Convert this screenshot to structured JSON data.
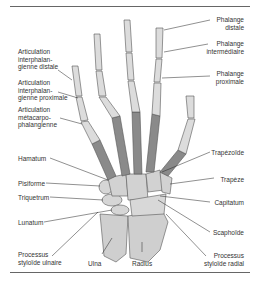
{
  "diagram": {
    "colors": {
      "phalanges": "#dcdcdc",
      "metacarpals": "#8a8a8a",
      "carpals": "#d2d2d2",
      "forearm": "#cfcfcf",
      "outline": "#555555",
      "leader": "#222222"
    },
    "labels_left": [
      {
        "id": "art-ipd",
        "text": "Articulation\ninterphalan-\ngienne distale"
      },
      {
        "id": "art-ipp",
        "text": "Articulation\ninterphalan-\ngienne proximale"
      },
      {
        "id": "art-mcp",
        "text": "Articulation\nmétacarpo-\nphalangienne"
      },
      {
        "id": "hamatum",
        "text": "Hamatum"
      },
      {
        "id": "pisiforme",
        "text": "Pisiforme"
      },
      {
        "id": "triquetrum",
        "text": "Triquetrum"
      },
      {
        "id": "lunatum",
        "text": "Lunatum"
      },
      {
        "id": "proc-ulnaire",
        "text": "Processus\nstyloïde ulnaire"
      }
    ],
    "labels_right": [
      {
        "id": "phal-distale",
        "text": "Phalange\ndistale"
      },
      {
        "id": "phal-inter",
        "text": "Phalange\nintermédiaire"
      },
      {
        "id": "phal-prox",
        "text": "Phalange\nproximale"
      },
      {
        "id": "trapezoide",
        "text": "Trapézoïde"
      },
      {
        "id": "trapeze",
        "text": "Trapèze"
      },
      {
        "id": "capitatum",
        "text": "Capitatum"
      },
      {
        "id": "scaphoide",
        "text": "Scaphoïde"
      },
      {
        "id": "proc-radial",
        "text": "Processus\nstyloïde radial"
      }
    ],
    "labels_bottom": [
      {
        "id": "ulna",
        "text": "Ulna"
      },
      {
        "id": "radius",
        "text": "Radius"
      }
    ]
  }
}
